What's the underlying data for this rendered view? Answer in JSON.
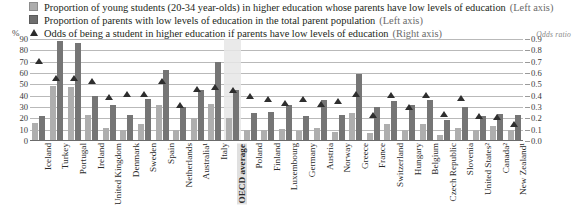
{
  "legend": {
    "items": [
      {
        "marker": "square-light-swatch-icon",
        "text": "Proportion of young students (20-34 year-olds) in higher education whose parents have low levels of education",
        "axis_note": "(Left axis)"
      },
      {
        "marker": "square-dark-swatch-icon",
        "text": "Proportion of parents with low levels of education in the total parent population",
        "axis_note": "(Left axis)"
      },
      {
        "marker": "triangle-marker-icon",
        "text": "Odds of being a student in higher education if parents have low levels of education",
        "axis_note": "(Right axis)"
      }
    ]
  },
  "axes": {
    "left_unit": "%",
    "right_unit": "Odds ratio",
    "left_ticks": [
      "90",
      "80",
      "70",
      "60",
      "50",
      "40",
      "30",
      "20",
      "10",
      "0"
    ],
    "right_ticks": [
      "0.9",
      "0.8",
      "0.7",
      "0.6",
      "0.5",
      "0.4",
      "0.3",
      "0.2",
      "0.1",
      "0.0"
    ]
  },
  "colors": {
    "bar_light": "#aeaeae",
    "bar_dark": "#757575",
    "marker": "#2e2e2e",
    "gridline": "#b9b9b9",
    "highlight_band": "#e6e6e6"
  },
  "chart_data": {
    "type": "bar",
    "title": "",
    "xlabel": "",
    "ylabel": "%",
    "ylim": [
      0,
      90
    ],
    "y2label": "Odds ratio",
    "y2lim": [
      0.0,
      0.9
    ],
    "grid": true,
    "legend_position": "top",
    "highlight_category": "OECD average",
    "categories": [
      "Iceland",
      "Turkey",
      "Portugal",
      "Ireland",
      "United Kingdom",
      "Denmark",
      "Sweden",
      "Spain",
      "Netherlands",
      "Australia¹",
      "Italy",
      "OECD average",
      "Poland",
      "Finland",
      "Luxembourg",
      "Germany",
      "Austria",
      "Norway",
      "Greece",
      "France",
      "Switzerland",
      "Hungary",
      "Belgium",
      "Czech Republic",
      "Slovenia",
      "United States²",
      "Canada²",
      "New Zealand¹"
    ],
    "series": [
      {
        "name": "Proportion of young students (20-34 year-olds) in higher education whose parents have low levels of education",
        "axis": "left",
        "values": [
          15,
          48,
          47,
          22,
          11,
          9,
          14,
          31,
          9,
          19,
          32,
          19,
          9,
          9,
          10,
          8,
          11,
          7,
          24,
          6,
          14,
          9,
          14,
          4,
          11,
          9,
          12,
          9
        ]
      },
      {
        "name": "Proportion of parents with low levels of education in the total parent population",
        "axis": "left",
        "values": [
          21,
          87,
          86,
          39,
          31,
          22,
          36,
          62,
          29,
          44,
          69,
          44,
          24,
          25,
          31,
          21,
          35,
          22,
          58,
          29,
          34,
          31,
          35,
          18,
          29,
          21,
          23,
          22
        ]
      },
      {
        "name": "Odds of being a student in higher education if parents have low levels of education",
        "axis": "right",
        "values": [
          0.7,
          0.55,
          0.55,
          0.52,
          0.38,
          0.41,
          0.41,
          0.52,
          0.31,
          0.45,
          0.47,
          0.44,
          0.39,
          0.36,
          0.33,
          0.36,
          0.32,
          0.34,
          0.41,
          0.22,
          0.4,
          0.29,
          0.4,
          0.23,
          0.37,
          0.21,
          0.2,
          0.14
        ]
      }
    ]
  }
}
